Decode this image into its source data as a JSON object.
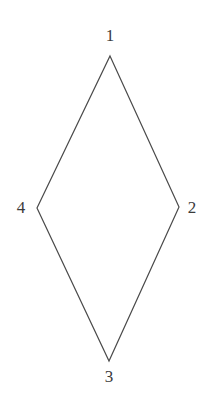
{
  "figure": {
    "kind": "geometry-diagram",
    "shape_name": "rhombus",
    "background_color": "#ffffff",
    "stroke_color": "#4a4a4a",
    "stroke_width": 1.2,
    "fill": "none",
    "canvas": {
      "width": 214,
      "height": 409
    },
    "vertices": [
      {
        "id": "1",
        "label": "1",
        "x": 110,
        "y": 56,
        "label_x": 110,
        "label_y": 35,
        "label_position": "above"
      },
      {
        "id": "2",
        "label": "2",
        "x": 179,
        "y": 207,
        "label_x": 192,
        "label_y": 207,
        "label_position": "right"
      },
      {
        "id": "3",
        "label": "3",
        "x": 109,
        "y": 361,
        "label_x": 109,
        "label_y": 376,
        "label_position": "below"
      },
      {
        "id": "4",
        "label": "4",
        "x": 37,
        "y": 208,
        "label_x": 21,
        "label_y": 207,
        "label_position": "left"
      }
    ],
    "edges": [
      {
        "from": "1",
        "to": "2"
      },
      {
        "from": "2",
        "to": "3"
      },
      {
        "from": "3",
        "to": "4"
      },
      {
        "from": "4",
        "to": "1"
      }
    ],
    "polygon_points": "110,56 179,207 109,361 37,208",
    "labels": {
      "top": "1",
      "right": "2",
      "bottom": "3",
      "left": "4"
    }
  }
}
